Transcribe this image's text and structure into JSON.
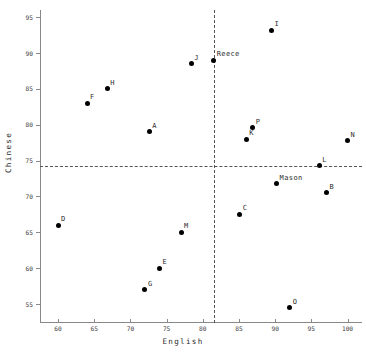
{
  "chart_data": {
    "type": "scatter",
    "title": "",
    "xlabel": "English",
    "ylabel": "Chinese",
    "xlim": [
      57.5,
      102
    ],
    "ylim": [
      52.5,
      96
    ],
    "grid": false,
    "legend": false,
    "xticks": [
      60,
      65,
      70,
      75,
      80,
      85,
      90,
      95,
      100
    ],
    "yticks": [
      55,
      60,
      65,
      70,
      75,
      80,
      85,
      90,
      95
    ],
    "xtick_labels": [
      "60",
      "65",
      "70",
      "75",
      "80",
      "85",
      "90",
      "95",
      "100"
    ],
    "ytick_labels": [
      "55",
      "60",
      "65",
      "70",
      "75",
      "80",
      "85",
      "90",
      "95"
    ],
    "reference_lines": [
      {
        "orientation": "horizontal",
        "value": 74.3,
        "style": "dashed"
      },
      {
        "orientation": "vertical",
        "value": 81.5,
        "style": "dashed"
      }
    ],
    "points": [
      {
        "label": "D",
        "x": 60.0,
        "y": 66.0,
        "label_dx": 3,
        "label_dy": -5
      },
      {
        "label": "F",
        "x": 64.0,
        "y": 83.0,
        "label_dx": 3,
        "label_dy": -5
      },
      {
        "label": "H",
        "x": 66.8,
        "y": 85.0,
        "label_dx": 3,
        "label_dy": -5
      },
      {
        "label": "G",
        "x": 72.0,
        "y": 57.0,
        "label_dx": 3,
        "label_dy": -5
      },
      {
        "label": "A",
        "x": 72.6,
        "y": 79.0,
        "label_dx": 3,
        "label_dy": -5
      },
      {
        "label": "E",
        "x": 74.0,
        "y": 60.0,
        "label_dx": 3,
        "label_dy": -5
      },
      {
        "label": "M",
        "x": 77.0,
        "y": 65.0,
        "label_dx": 3,
        "label_dy": -5
      },
      {
        "label": "J",
        "x": 78.4,
        "y": 88.5,
        "label_dx": 3,
        "label_dy": -5
      },
      {
        "label": "Reece",
        "x": 81.5,
        "y": 89.0,
        "label_dx": 3,
        "label_dy": -5
      },
      {
        "label": "C",
        "x": 85.1,
        "y": 67.5,
        "label_dx": 3,
        "label_dy": -5
      },
      {
        "label": "K",
        "x": 86.0,
        "y": 78.0,
        "label_dx": 3,
        "label_dy": -5
      },
      {
        "label": "P",
        "x": 86.9,
        "y": 79.6,
        "label_dx": 3,
        "label_dy": -5
      },
      {
        "label": "I",
        "x": 89.5,
        "y": 93.2,
        "label_dx": 3,
        "label_dy": -5
      },
      {
        "label": "Mason",
        "x": 90.2,
        "y": 71.8,
        "label_dx": 3,
        "label_dy": -5
      },
      {
        "label": "O",
        "x": 92.0,
        "y": 54.5,
        "label_dx": 3,
        "label_dy": -5
      },
      {
        "label": "L",
        "x": 96.1,
        "y": 74.3,
        "label_dx": 3,
        "label_dy": -5
      },
      {
        "label": "B",
        "x": 97.1,
        "y": 70.5,
        "label_dx": 3,
        "label_dy": -5
      },
      {
        "label": "N",
        "x": 100.0,
        "y": 77.8,
        "label_dx": 3,
        "label_dy": -5
      }
    ]
  },
  "colors": {
    "point": "#000000",
    "axis": "#888888",
    "dashed": "#555555",
    "text": "#2b2b2b",
    "background": "#ffffff"
  }
}
